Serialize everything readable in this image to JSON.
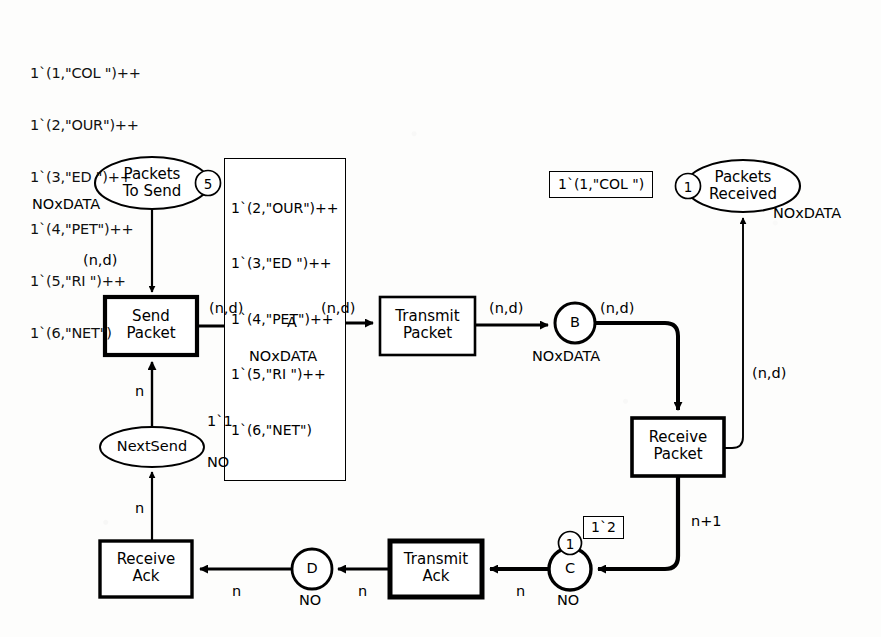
{
  "diagram": {
    "type": "cpn-petri-net"
  },
  "initial_marking": {
    "name": "packets-to-send-initial-marking",
    "lines": [
      "1`(1,\"COL \")++",
      "1`(2,\"OUR\")++",
      "1`(3,\"ED \")++",
      "1`(4,\"PET\")++",
      "1`(5,\"RI \")++",
      "1`(6,\"NET\")"
    ]
  },
  "places": {
    "packets_to_send": {
      "label": "Packets\nTo Send",
      "type": "NOxDATA",
      "token_count": "5",
      "marking_lines": [
        "1`(2,\"OUR\")++",
        "1`(3,\"ED \")++",
        "1`(4,\"PET\")++",
        "1`(5,\"RI \")++",
        "1`(6,\"NET\")"
      ]
    },
    "packets_received": {
      "label": "Packets\nReceived",
      "type": "NOxDATA",
      "token_count": "1",
      "marking": "1`(1,\"COL \")"
    },
    "a": {
      "label": "A",
      "type": "NOxDATA"
    },
    "b": {
      "label": "B",
      "type": "NOxDATA"
    },
    "c": {
      "label": "C",
      "type": "NO",
      "token_count": "1",
      "marking": "1`2"
    },
    "d": {
      "label": "D",
      "type": "NO"
    },
    "next_send": {
      "label": "NextSend",
      "type": "NO",
      "marking": "1`1"
    }
  },
  "transitions": {
    "send_packet": {
      "label": "Send\nPacket"
    },
    "transmit_packet": {
      "label": "Transmit\nPacket"
    },
    "receive_packet": {
      "label": "Receive\nPacket"
    },
    "transmit_ack": {
      "label": "Transmit\nAck"
    },
    "receive_ack": {
      "label": "Receive\nAck"
    }
  },
  "arc_labels": {
    "pts_to_send": "(n,d)",
    "send_to_a": "(n,d)",
    "a_to_transmit": "(n,d)",
    "transmit_to_b": "(n,d)",
    "b_to_receive": "(n,d)",
    "receive_to_received": "(n,d)",
    "receive_to_c": "n+1",
    "c_to_transmit_ack": "n",
    "transmit_ack_to_d": "n",
    "d_to_receive_ack": "n",
    "receive_ack_to_nextsend": "n",
    "nextsend_to_send": "n"
  },
  "colors": {
    "stroke": "#000000",
    "fill": "#ffffff",
    "paper": "#fdfdfc"
  }
}
